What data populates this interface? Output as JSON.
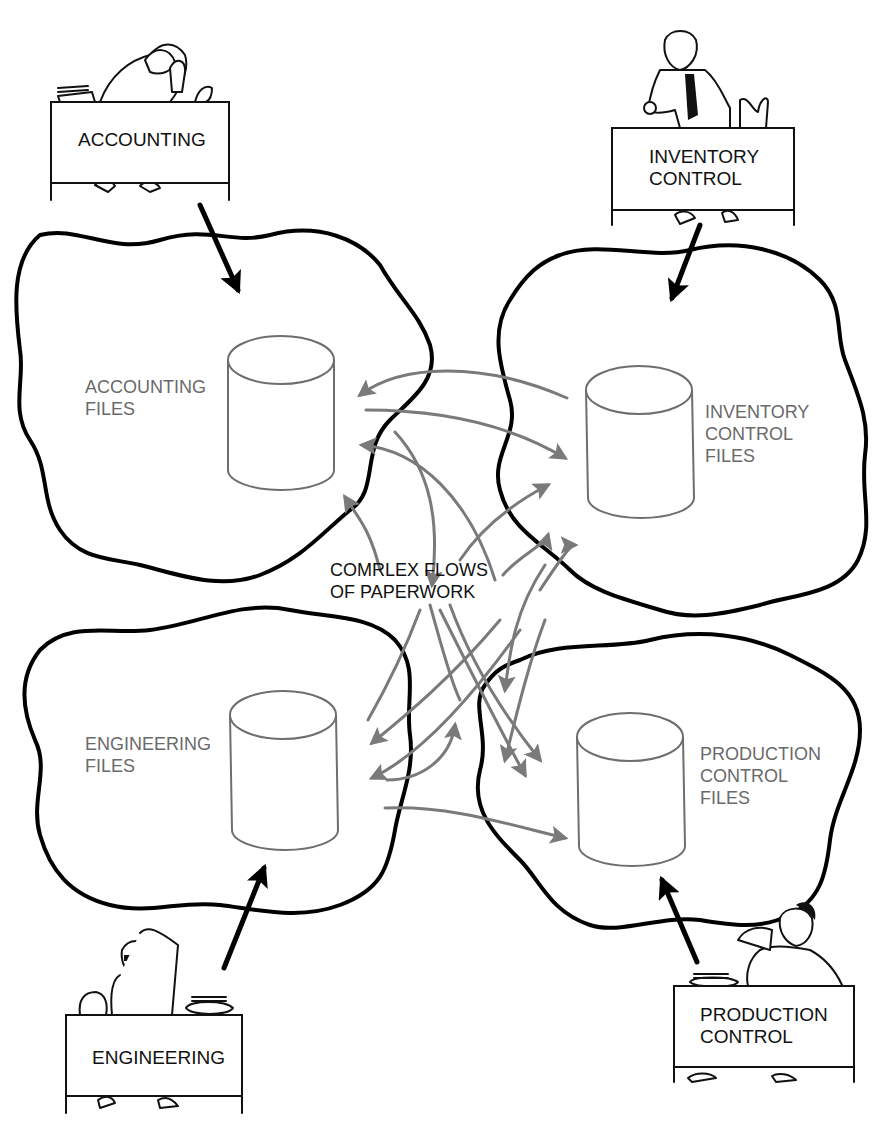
{
  "diagram": {
    "title": "",
    "departments": {
      "accounting": {
        "desk_label": [
          "ACCOUNTING"
        ],
        "files_label": [
          "ACCOUNTING",
          "FILES"
        ]
      },
      "inventory": {
        "desk_label": [
          "INVENTORY",
          "CONTROL"
        ],
        "files_label": [
          "INVENTORY",
          "CONTROL",
          "FILES"
        ]
      },
      "engineering": {
        "desk_label": [
          "ENGINEERING"
        ],
        "files_label": [
          "ENGINEERING",
          "FILES"
        ]
      },
      "production": {
        "desk_label": [
          "PRODUCTION",
          "CONTROL"
        ],
        "files_label": [
          "PRODUCTION",
          "CONTROL",
          "FILES"
        ]
      }
    },
    "center_label": [
      "COMRLEX FLOWS",
      "OF PAPERWORK"
    ],
    "colors": {
      "outline": "#000000",
      "flow_arrows": "#7a7a7a",
      "files_text": "#6a6a6a",
      "background": "#ffffff"
    }
  }
}
